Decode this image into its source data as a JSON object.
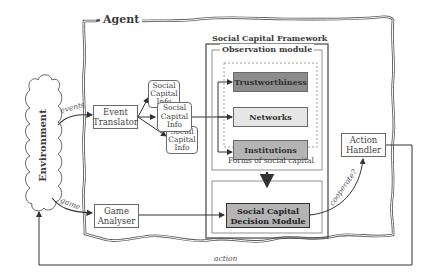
{
  "diagram": {
    "agent_label": "Agent",
    "framework_title": "Social Capital Framework",
    "observation_module_label": "Observation module",
    "forms_label": "Forms of social capital",
    "environment_label": "Environment",
    "nodes": {
      "event_translator": "Event Translator",
      "event_translator_l1": "Event",
      "event_translator_l2": "Translator",
      "game_analyser_l1": "Game",
      "game_analyser_l2": "Analyser",
      "sci_l1": "Social",
      "sci_l2": "Capital",
      "sci_l3": "Info",
      "trustworthiness": "Trustworthiness",
      "networks": "Networks",
      "institutions": "Institutions",
      "decision_l1": "Social Capital",
      "decision_l2": "Decision Module",
      "action_handler_l1": "Action",
      "action_handler_l2": "Handler"
    },
    "edges": {
      "events": "events",
      "game": "game",
      "cooperate": "cooperate?",
      "action": "action"
    },
    "colors": {
      "trustworthiness_fill": "#8c8c8c",
      "networks_fill": "#e6e6e6",
      "institutions_fill": "#b4b4b4",
      "decision_fill": "#b4b4b4",
      "line": "#444444"
    }
  }
}
